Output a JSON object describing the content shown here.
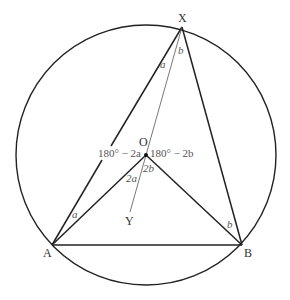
{
  "diagram": {
    "type": "circle-geometry",
    "circle": {
      "cx": 146,
      "cy": 155,
      "r": 130,
      "stroke": "#222222"
    },
    "points": {
      "X": {
        "label": "X",
        "x": 182,
        "y": 27
      },
      "A": {
        "label": "A",
        "x": 52,
        "y": 245
      },
      "B": {
        "label": "B",
        "x": 242,
        "y": 245
      },
      "O": {
        "label": "O",
        "x": 146,
        "y": 155
      },
      "Y": {
        "label": "Y",
        "x": 130,
        "y": 213
      }
    },
    "segments": [
      {
        "from": "A",
        "to": "X",
        "weight": "bold"
      },
      {
        "from": "X",
        "to": "B",
        "weight": "bold"
      },
      {
        "from": "A",
        "to": "B",
        "weight": "bold"
      },
      {
        "from": "A",
        "to": "O",
        "weight": "bold"
      },
      {
        "from": "O",
        "to": "B",
        "weight": "bold"
      },
      {
        "from": "X",
        "to": "Y",
        "weight": "thin"
      }
    ],
    "angle_labels": {
      "x_left": "a",
      "x_right": "b",
      "o_upper_left": "180° − 2a",
      "o_upper_right": "180° − 2b",
      "o_lower_left": "2a",
      "o_lower_right": "2b",
      "a_angle": "a",
      "b_angle": "b"
    }
  }
}
